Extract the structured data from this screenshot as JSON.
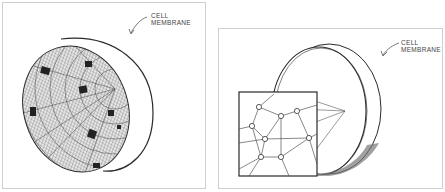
{
  "figure": {
    "panels": [
      {
        "id": "left",
        "description": "Hemisphere of a cell showing a dense cytoskeletal mesh lining the inner surface of the membrane, with dark clusters",
        "label": {
          "line1": "CELL",
          "line2": "MEMBRANE"
        }
      },
      {
        "id": "right",
        "description": "Half-cell disc with a magnified inset showing a network of filaments joined at nodes",
        "label": {
          "line1": "CELL",
          "line2": "MEMBRANE"
        }
      }
    ],
    "colors": {
      "ink": "#2a2a2a",
      "hatch": "#555555",
      "border": "#cfcfcf",
      "background": "#ffffff"
    }
  }
}
